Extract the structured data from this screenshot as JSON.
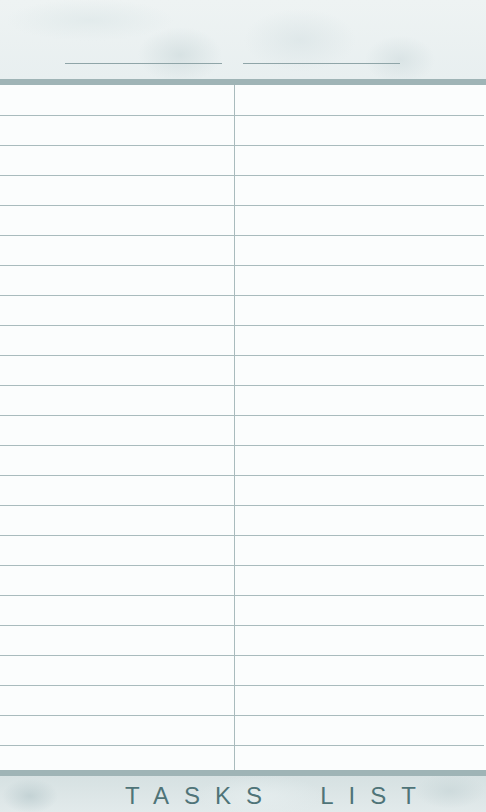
{
  "header": {
    "fill_lines": [
      {
        "label": "",
        "value": ""
      },
      {
        "label": "",
        "value": ""
      }
    ]
  },
  "grid": {
    "columns": 2,
    "rows": 23,
    "cells": []
  },
  "footer": {
    "title": "TASKS  LIST"
  },
  "colors": {
    "accent": "#9fb4b6",
    "rule": "#a9bbbd",
    "title": "#4f7478"
  }
}
